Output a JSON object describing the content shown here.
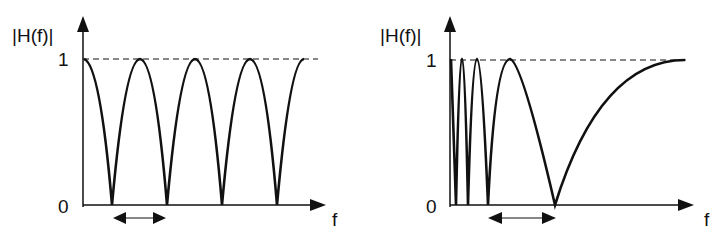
{
  "panels": [
    {
      "id": "left",
      "y_axis_label": "|H(f)|",
      "x_axis_label": "f",
      "tick_one": "1",
      "tick_zero": "0",
      "description": "Comb filter: uniformly spaced notches (linear frequency spacing)"
    },
    {
      "id": "right",
      "y_axis_label": "|H(f)|",
      "x_axis_label": "f",
      "tick_one": "1",
      "tick_zero": "0",
      "description": "Notches spaced increasingly wider with frequency"
    }
  ],
  "colors": {
    "stroke": "#111111",
    "background": "#ffffff"
  }
}
